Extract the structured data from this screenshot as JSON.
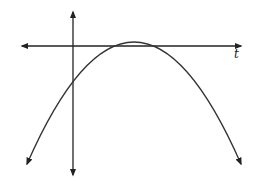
{
  "figure": {
    "type": "function-graph",
    "axes": {
      "horizontal_label": "t",
      "vertical_label": ""
    },
    "curve": {
      "shape": "parabola",
      "opens": "down",
      "vertex_above_axis": true,
      "x_intercepts": 2,
      "y_intercept_sign": "negative",
      "color": "#333333"
    },
    "colors": {
      "background": "#ffffff",
      "axis": "#222222",
      "curve": "#333333"
    }
  }
}
